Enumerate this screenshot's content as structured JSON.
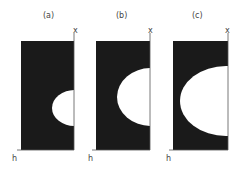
{
  "figure": {
    "panels": [
      {
        "label": "(a)",
        "x_axis_label": "x",
        "y_axis_label": "h"
      },
      {
        "label": "(b)",
        "x_axis_label": "x",
        "y_axis_label": "h"
      },
      {
        "label": "(c)",
        "x_axis_label": "x",
        "y_axis_label": "h"
      }
    ],
    "colors": {
      "region": "#1a1a1a",
      "bubble": "#ffffff",
      "axis": "#555555"
    }
  }
}
